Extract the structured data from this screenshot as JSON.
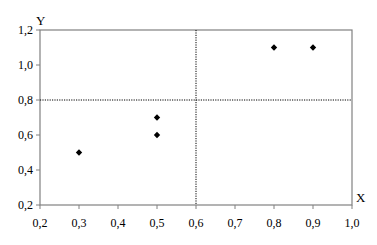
{
  "chart_data": {
    "type": "scatter",
    "title": "",
    "xlabel": "X",
    "ylabel": "Y",
    "xlim": [
      0.2,
      1.0
    ],
    "ylim": [
      0.2,
      1.2
    ],
    "x_ticks": [
      0.2,
      0.3,
      0.4,
      0.5,
      0.6,
      0.7,
      0.8,
      0.9,
      1.0
    ],
    "x_tick_labels": [
      "0,2",
      "0,3",
      "0,4",
      "0,5",
      "0,6",
      "0,7",
      "0,8",
      "0,9",
      "1,0"
    ],
    "y_ticks": [
      0.2,
      0.4,
      0.6,
      0.8,
      1.0,
      1.2
    ],
    "y_tick_labels": [
      "0,2",
      "0,4",
      "0,6",
      "0,8",
      "1,0",
      "1,2"
    ],
    "grid": false,
    "legend": null,
    "reference_lines": [
      {
        "orientation": "vertical",
        "value": 0.6,
        "style": "dotted"
      },
      {
        "orientation": "horizontal",
        "value": 0.8,
        "style": "dotted"
      }
    ],
    "series": [
      {
        "name": "points",
        "marker": "diamond",
        "color": "#000000",
        "x": [
          0.3,
          0.5,
          0.5,
          0.8,
          0.9
        ],
        "y": [
          0.5,
          0.7,
          0.6,
          1.1,
          1.1
        ]
      }
    ]
  },
  "colors": {
    "frame": "#808080",
    "reference_line": "#000000",
    "marker": "#000000"
  }
}
